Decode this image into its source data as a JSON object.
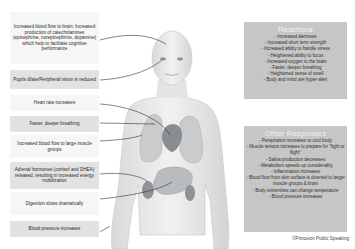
{
  "diagram": {
    "left_labels": [
      {
        "text": "Increased blood flow to brain; Increased production of catecholamines (epinephrine, norepinephrine, dopamine) which help to facilitate cognitive performance"
      },
      {
        "text": "Pupils dilate/Peripheral vision is reduced"
      },
      {
        "text": "Heart rate increases"
      },
      {
        "text": "Faster, deeper breathing"
      },
      {
        "text": "Increased blood flow to large muscle groups"
      },
      {
        "text": "Adrenal hormones (cortisol and DHEA) released, resulting in increased energy mobilization"
      },
      {
        "text": "Digestion slows dramatically"
      },
      {
        "text": "Blood pressure increases"
      }
    ],
    "reactions": {
      "title": "Reactions",
      "items": [
        "- Increased alertness",
        "- Increased short term strength",
        "- Increased ability to handle stress",
        "- Heightened ability to focus",
        "- Increased oxygen to the brain",
        "- Faster, deeper breathing",
        "- Heightened sense of smell",
        "- Body and mind are hyper-alert"
      ]
    },
    "other_responses": {
      "title": "Other Responses",
      "items": [
        "- Perspiration increases to cool body",
        "- Muscle tension increases to prepare for \"fight or flight\"",
        "- Saliva production decreases",
        "- Metabolism speeds up considerably",
        "- Inflammation increases",
        "- Blood flow from skin surface is diverted to larger muscle groups & brain",
        "- Body extremities can change temperature",
        "- Blood pressure increases"
      ]
    },
    "credit": "©Princeton Public Speaking",
    "colors": {
      "panel_bg": "#c6c6c6",
      "panel_title": "#f2f2f2",
      "label_shade": "#e2e2e2",
      "label_light": "#f6f6f6",
      "heart": "#8a8d92",
      "organs": "#b9bcbf"
    }
  }
}
